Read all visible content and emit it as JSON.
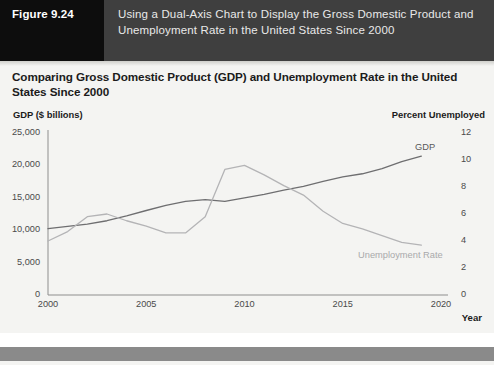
{
  "figure": {
    "tag": "Figure 9.24",
    "caption": "Using a Dual-Axis Chart to Display the Gross Domestic Product and Unemployment Rate in the United States Since 2000"
  },
  "chart_data": {
    "type": "line",
    "title": "Comparing Gross Domestic Product (GDP) and Unemployment Rate in the United States Since 2000",
    "xlabel": "Year",
    "ylabel": "GDP ($ billions)",
    "y2label": "Percent Unemployed",
    "grid": false,
    "legend": "inline-labels",
    "xlim": [
      2000,
      2020
    ],
    "xticks": [
      2000,
      2005,
      2010,
      2015,
      2020
    ],
    "xticklabels": [
      "2000",
      "2005",
      "2010",
      "2015",
      "2020"
    ],
    "ylim": [
      0,
      25000
    ],
    "yticks": [
      0,
      5000,
      10000,
      15000,
      20000,
      25000
    ],
    "yticklabels": [
      "0",
      "5,000",
      "10,000",
      "15,000",
      "20,000",
      "25,000"
    ],
    "y2lim": [
      0,
      12
    ],
    "y2ticks": [
      0,
      2,
      4,
      6,
      8,
      10,
      12
    ],
    "y2ticklabels": [
      "0",
      "2",
      "4",
      "6",
      "8",
      "10",
      "12"
    ],
    "x": [
      2000,
      2001,
      2002,
      2003,
      2004,
      2005,
      2006,
      2007,
      2008,
      2009,
      2010,
      2011,
      2012,
      2013,
      2014,
      2015,
      2016,
      2017,
      2018,
      2019
    ],
    "series": [
      {
        "name": "GDP",
        "axis": "left",
        "color": "#6e6e70",
        "label_text": "GDP",
        "values": [
          10250,
          10580,
          10940,
          11460,
          12210,
          13040,
          13815,
          14450,
          14710,
          14450,
          14990,
          15540,
          16200,
          16780,
          17520,
          18220,
          18710,
          19490,
          20580,
          21430
        ]
      },
      {
        "name": "Unemployment Rate",
        "axis": "right",
        "color": "#b4b4b6",
        "label_text": "Unemployment Rate",
        "values": [
          4.0,
          4.7,
          5.8,
          6.0,
          5.5,
          5.1,
          4.6,
          4.6,
          5.8,
          9.3,
          9.6,
          8.9,
          8.1,
          7.4,
          6.2,
          5.3,
          4.9,
          4.4,
          3.9,
          3.7
        ]
      }
    ]
  }
}
